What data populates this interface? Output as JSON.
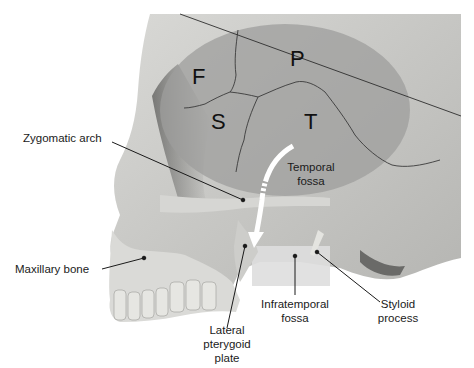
{
  "figure": {
    "bone_regions": [
      {
        "letter": "F",
        "name": "Frontal"
      },
      {
        "letter": "P",
        "name": "Parietal"
      },
      {
        "letter": "S",
        "name": "Sphenoid"
      },
      {
        "letter": "T",
        "name": "Temporal"
      }
    ],
    "labels": {
      "zygomatic_arch": "Zygomatic arch",
      "maxillary_bone": "Maxillary bone",
      "temporal_fossa_line1": "Temporal",
      "temporal_fossa_line2": "fossa",
      "infratemporal_fossa_line1": "Infratemporal",
      "infratemporal_fossa_line2": "fossa",
      "styloid_process_line1": "Styloid",
      "styloid_process_line2": "process",
      "lateral_pterygoid_line1": "Lateral",
      "lateral_pterygoid_line2": "pterygoid",
      "lateral_pterygoid_line3": "plate"
    },
    "colors": {
      "background": "#ffffff",
      "bone": "#cfcfcc",
      "bone_shadow": "#8a8a88",
      "temporal_fossa_overlay": "#9e9e9c",
      "infratemporal_fossa_overlay": "#dcdcdc",
      "arrow": "#ffffff",
      "leader_line": "#1a1a1a"
    }
  }
}
